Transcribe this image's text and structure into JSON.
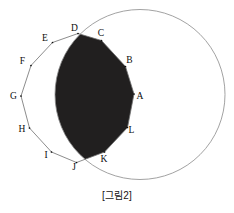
{
  "figure": {
    "caption": "[그림2]",
    "colors": {
      "background": "#ffffff",
      "stroke": "#8a8a8a",
      "polygon_stroke": "#6e6e6e",
      "fill": "#211f1f",
      "label": "#0d0d0d"
    },
    "circle": {
      "label": "circle",
      "cx": 140,
      "cy": 94.5,
      "r": 85,
      "stroke_width": 0.8
    },
    "polygon": {
      "label": "dodecagon",
      "sides": 12,
      "stroke_width": 0.8,
      "vertex_count": 12,
      "vertices": [
        {
          "name": "A",
          "x": 134.0,
          "y": 94.0,
          "label_x": 140.0,
          "label_y": 98.5
        },
        {
          "name": "B",
          "x": 125.5,
          "y": 66.5,
          "label_x": 129.5,
          "label_y": 63.0
        },
        {
          "name": "C",
          "x": 101.5,
          "y": 40.5,
          "label_x": 101.0,
          "label_y": 36.0
        },
        {
          "name": "D",
          "x": 78.0,
          "y": 33.5,
          "label_x": 74.5,
          "label_y": 30.5
        },
        {
          "name": "E",
          "x": 52.5,
          "y": 42.5,
          "label_x": 45.0,
          "label_y": 40.5
        },
        {
          "name": "F",
          "x": 31.0,
          "y": 65.5,
          "label_x": 22.5,
          "label_y": 64.0
        },
        {
          "name": "G",
          "x": 21.0,
          "y": 96.0,
          "label_x": 13.5,
          "label_y": 98.5
        },
        {
          "name": "H",
          "x": 29.5,
          "y": 128.0,
          "label_x": 22.0,
          "label_y": 132.0
        },
        {
          "name": "I",
          "x": 51.5,
          "y": 152.0,
          "label_x": 46.0,
          "label_y": 157.5
        },
        {
          "name": "J",
          "x": 76.5,
          "y": 162.5,
          "label_x": 74.0,
          "label_y": 170.0
        },
        {
          "name": "K",
          "x": 104.5,
          "y": 152.0,
          "label_x": 104.0,
          "label_y": 161.5
        },
        {
          "name": "L",
          "x": 127.5,
          "y": 127.5,
          "label_x": 131.5,
          "label_y": 132.5
        }
      ]
    },
    "shaded_region": {
      "label": "intersection-of-circle-and-polygon",
      "description": "filled overlap region"
    }
  }
}
